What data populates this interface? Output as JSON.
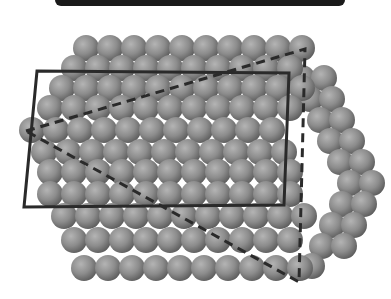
{
  "figure": {
    "colors": {
      "sphere_light": "#b4b4b4",
      "sphere_mid": "#8c8c8c",
      "sphere_dark": "#5a5a5a",
      "outline": "#2a2a2a",
      "topbar": "#1a1a1a"
    },
    "sphere_radius": 13,
    "back_rows": [
      {
        "y": 58,
        "x0": 290,
        "count": 1
      },
      {
        "y": 78,
        "x0": 302,
        "count": 2
      },
      {
        "y": 99,
        "x0": 310,
        "count": 2
      },
      {
        "y": 120,
        "x0": 320,
        "count": 2
      },
      {
        "y": 141,
        "x0": 330,
        "count": 2
      },
      {
        "y": 162,
        "x0": 340,
        "count": 2
      },
      {
        "y": 183,
        "x0": 350,
        "count": 2
      },
      {
        "y": 204,
        "x0": 342,
        "count": 2
      },
      {
        "y": 225,
        "x0": 332,
        "count": 2
      },
      {
        "y": 246,
        "x0": 322,
        "count": 2
      },
      {
        "y": 266,
        "x0": 312,
        "count": 1
      }
    ],
    "front_rows": [
      {
        "y": 48,
        "x0": 86,
        "count": 10,
        "dx": 24
      },
      {
        "y": 68,
        "x0": 74,
        "count": 10,
        "dx": 24
      },
      {
        "y": 88,
        "x0": 62,
        "count": 11,
        "dx": 24
      },
      {
        "y": 108,
        "x0": 50,
        "count": 11,
        "dx": 24
      },
      {
        "y": 130,
        "x0": 32,
        "count": 11,
        "dx": 24
      },
      {
        "y": 152,
        "x0": 44,
        "count": 11,
        "dx": 24
      },
      {
        "y": 172,
        "x0": 50,
        "count": 11,
        "dx": 24
      },
      {
        "y": 194,
        "x0": 50,
        "count": 11,
        "dx": 24
      },
      {
        "y": 216,
        "x0": 64,
        "count": 11,
        "dx": 24
      },
      {
        "y": 240,
        "x0": 74,
        "count": 10,
        "dx": 24
      },
      {
        "y": 268,
        "x0": 84,
        "count": 10,
        "dx": 24
      }
    ],
    "rectangle": {
      "points": "37,71 289,73 284,205 24,207"
    },
    "triangle": {
      "points": "26,131 305,49 299,282"
    }
  }
}
